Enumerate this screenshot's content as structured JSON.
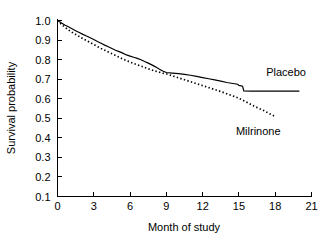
{
  "chart_data": {
    "type": "line",
    "title": "",
    "subtitle": "",
    "xlabel": "Month of study",
    "ylabel": "Survival probability",
    "xlim": [
      0,
      21
    ],
    "ylim": [
      0.1,
      1.0
    ],
    "xticks": [
      "0",
      "3",
      "6",
      "9",
      "12",
      "15",
      "18",
      "21"
    ],
    "xtick_values": [
      0,
      3,
      6,
      9,
      12,
      15,
      18,
      21
    ],
    "yticks": [
      "1.0",
      "0.9",
      "0.8",
      "0.7",
      "0.6",
      "0.5",
      "0.4",
      "0.3",
      "0.2",
      "0.1"
    ],
    "ytick_values": [
      1.0,
      0.9,
      0.8,
      0.7,
      0.6,
      0.5,
      0.4,
      0.3,
      0.2,
      0.1
    ],
    "grid": false,
    "legend_position": "inline-right",
    "series": [
      {
        "name": "Placebo",
        "style": "solid",
        "color": "#000000",
        "label_x": 18.9,
        "label_y": 0.715,
        "x": [
          0.0,
          0.3,
          0.6,
          0.9,
          1.2,
          1.5,
          1.8,
          2.1,
          2.4,
          2.7,
          3.0,
          3.3,
          3.6,
          3.9,
          4.2,
          4.5,
          4.8,
          5.1,
          5.4,
          5.7,
          6.0,
          6.3,
          6.6,
          6.9,
          7.2,
          7.5,
          7.8,
          8.1,
          8.4,
          8.7,
          9.0,
          9.5,
          10.0,
          10.5,
          11.0,
          11.5,
          12.0,
          12.5,
          13.0,
          13.5,
          14.0,
          14.5,
          14.9,
          15.0,
          15.3,
          15.4,
          16.0,
          17.0,
          18.0,
          19.0,
          20.0
        ],
        "y": [
          1.0,
          0.988,
          0.977,
          0.968,
          0.958,
          0.948,
          0.939,
          0.929,
          0.921,
          0.912,
          0.903,
          0.893,
          0.884,
          0.874,
          0.866,
          0.857,
          0.848,
          0.841,
          0.833,
          0.824,
          0.818,
          0.812,
          0.806,
          0.799,
          0.79,
          0.782,
          0.773,
          0.763,
          0.752,
          0.742,
          0.734,
          0.731,
          0.728,
          0.724,
          0.72,
          0.714,
          0.708,
          0.702,
          0.696,
          0.69,
          0.683,
          0.678,
          0.674,
          0.668,
          0.664,
          0.64,
          0.639,
          0.639,
          0.639,
          0.639,
          0.639
        ]
      },
      {
        "name": "Milrinone",
        "style": "dotted",
        "color": "#000000",
        "label_x": 16.6,
        "label_y": 0.415,
        "x": [
          0.0,
          0.3,
          0.6,
          0.9,
          1.2,
          1.5,
          1.8,
          2.1,
          2.4,
          2.7,
          3.0,
          3.3,
          3.6,
          3.9,
          4.2,
          4.5,
          4.8,
          5.1,
          5.4,
          5.7,
          6.0,
          6.3,
          6.6,
          6.9,
          7.2,
          7.5,
          7.8,
          8.1,
          8.4,
          8.7,
          9.0,
          9.4,
          9.8,
          10.2,
          10.6,
          11.0,
          11.4,
          11.8,
          12.2,
          12.6,
          13.0,
          13.4,
          13.8,
          14.2,
          14.6,
          15.0,
          15.4,
          15.8,
          16.2,
          16.6,
          17.0,
          17.4,
          17.7,
          17.9
        ],
        "y": [
          1.0,
          0.982,
          0.966,
          0.952,
          0.94,
          0.929,
          0.918,
          0.907,
          0.897,
          0.887,
          0.877,
          0.867,
          0.857,
          0.848,
          0.839,
          0.83,
          0.821,
          0.812,
          0.803,
          0.795,
          0.787,
          0.78,
          0.773,
          0.767,
          0.76,
          0.753,
          0.747,
          0.741,
          0.736,
          0.731,
          0.727,
          0.719,
          0.711,
          0.703,
          0.695,
          0.687,
          0.679,
          0.671,
          0.663,
          0.655,
          0.647,
          0.639,
          0.63,
          0.621,
          0.612,
          0.602,
          0.59,
          0.577,
          0.564,
          0.552,
          0.541,
          0.528,
          0.518,
          0.512
        ]
      }
    ]
  }
}
